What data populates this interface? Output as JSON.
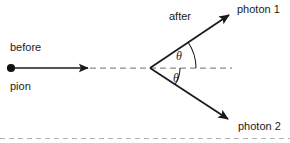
{
  "figure": {
    "background_color": "#ffffff",
    "stroke_color": "#1a1a1a",
    "dash_color": "#8c8c8c",
    "bottom_rule_color": "#b3b3b3",
    "labels": {
      "before": "before",
      "pion": "pion",
      "after": "after",
      "photon1": "photon 1",
      "photon2": "photon 2",
      "theta_upper": "θ",
      "theta_lower": "θ"
    },
    "geometry": {
      "vertex": [
        150,
        68
      ],
      "pion_dot": [
        11,
        68
      ],
      "pion_arrow_tip": [
        88,
        68
      ],
      "axis_dash_start": [
        90,
        68
      ],
      "axis_dash_end": [
        232,
        68
      ],
      "photon1_tip": [
        233,
        12
      ],
      "photon2_tip": [
        232,
        122
      ],
      "theta_upper_degrees": 34,
      "theta_lower_degrees": 33,
      "arc_upper_radius": 46,
      "arc_lower_radius": 30,
      "bottom_rule_y": 138
    }
  }
}
